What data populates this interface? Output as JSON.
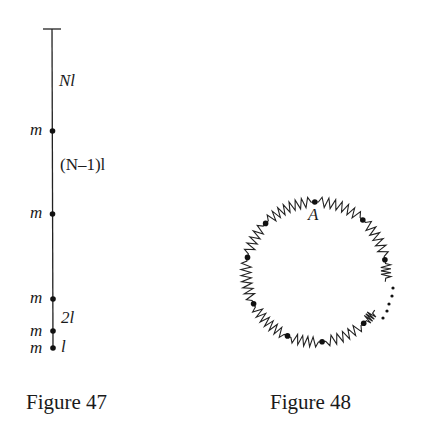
{
  "figure47": {
    "caption": "Figure 47",
    "mass_label": "m",
    "segment_labels": [
      "Nl",
      "(N–1)l",
      "2l",
      "l"
    ],
    "masses": 5
  },
  "figure48": {
    "caption": "Figure 48",
    "point_label": "A",
    "masses": 9
  }
}
